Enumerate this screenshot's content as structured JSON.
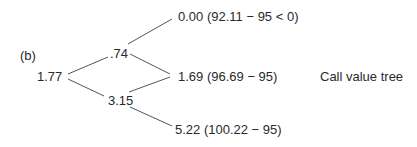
{
  "panel_label": "(b)",
  "caption": "Call value tree",
  "tree": {
    "root": {
      "value": "1.77"
    },
    "step1": {
      "up": {
        "value": ".74"
      },
      "down": {
        "value": "3.15"
      }
    },
    "step2": {
      "uu": {
        "label": "0.00 (92.11 − 95 < 0)",
        "value": "0.00",
        "stock_price": "92.11",
        "strike": "95"
      },
      "ud": {
        "label": "1.69 (96.69 − 95)",
        "value": "1.69",
        "stock_price": "96.69",
        "strike": "95"
      },
      "dd": {
        "label": "5.22 (100.22 − 95)",
        "value": "5.22",
        "stock_price": "100.22",
        "strike": "95"
      }
    }
  },
  "edges": [
    {
      "from": "root",
      "to": "up"
    },
    {
      "from": "root",
      "to": "down"
    },
    {
      "from": "up",
      "to": "uu"
    },
    {
      "from": "up",
      "to": "ud"
    },
    {
      "from": "down",
      "to": "ud"
    },
    {
      "from": "down",
      "to": "dd"
    }
  ],
  "colors": {
    "line": "#555555",
    "text": "#2a2a2a",
    "background": "#ffffff"
  }
}
